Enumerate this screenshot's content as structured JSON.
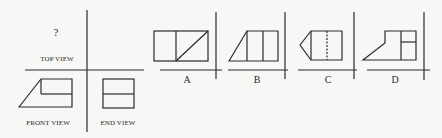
{
  "question": {
    "unknown_mark": "?",
    "views": {
      "top": "TOP VIEW",
      "front": "FRONT VIEW",
      "end": "END VIEW"
    }
  },
  "options": [
    {
      "label": "A",
      "description": "rectangle split by vertical line, right cell with diagonal"
    },
    {
      "label": "B",
      "description": "trapezoid with slanted left side and two inner vertical lines"
    },
    {
      "label": "C",
      "description": "pentagon with pointed left side and dashed inner vertical line"
    },
    {
      "label": "D",
      "description": "stepped shape with slanted lower left, right section split by vertical and horizontal lines"
    }
  ],
  "colors": {
    "line": "#2a2a2a",
    "background": "#f7f7f5"
  }
}
